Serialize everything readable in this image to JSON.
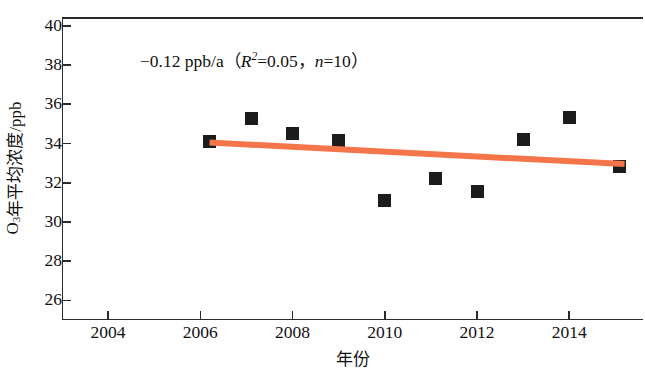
{
  "chart_data": {
    "type": "scatter",
    "title": "",
    "xlabel": "年份",
    "ylabel": "O₃年平均浓度/ppb",
    "ylabel_main": "年平均浓度/ppb",
    "ylabel_species": "O",
    "ylabel_sub": "3",
    "xlim": [
      2003.0,
      2015.6
    ],
    "ylim": [
      25.0,
      40.4
    ],
    "xticks": [
      2004,
      2006,
      2008,
      2010,
      2012,
      2014
    ],
    "xtick_labels": [
      "2004",
      "2006",
      "2008",
      "2010",
      "2012",
      "2014"
    ],
    "yticks": [
      26,
      28,
      30,
      32,
      34,
      36,
      38,
      40
    ],
    "ytick_labels": [
      "26",
      "28",
      "30",
      "32",
      "34",
      "36",
      "38",
      "40"
    ],
    "grid": false,
    "legend": false,
    "marker_shape": "square",
    "marker_color": "#1c1c1c",
    "trend_color": "#F4754A",
    "x": [
      2006.2,
      2007.1,
      2008.0,
      2009.0,
      2010.0,
      2011.1,
      2012.0,
      2013.0,
      2014.0,
      2015.1
    ],
    "values": [
      34.1,
      35.25,
      34.5,
      34.15,
      31.1,
      32.2,
      31.55,
      34.2,
      35.35,
      32.85
    ],
    "series": [
      {
        "name": "O₃年平均浓度",
        "x": [
          2006.2,
          2007.1,
          2008.0,
          2009.0,
          2010.0,
          2011.1,
          2012.0,
          2013.0,
          2014.0,
          2015.1
        ],
        "values": [
          34.1,
          35.25,
          34.5,
          34.15,
          31.1,
          32.2,
          31.55,
          34.2,
          35.35,
          32.85
        ]
      }
    ],
    "trendline": {
      "x_start": 2006.2,
      "x_end": 2015.2,
      "y_start": 34.05,
      "y_end": 32.95,
      "slope_per_year": -0.12
    },
    "annotation": {
      "slope_text": "−0.12 ppb/a",
      "open_paren": "（",
      "r2_symbol": "R",
      "r2_sup": "2",
      "r2_value": "=0.05",
      "comma": "，",
      "n_symbol": "n",
      "n_value": "=10",
      "close_paren": "）"
    }
  }
}
